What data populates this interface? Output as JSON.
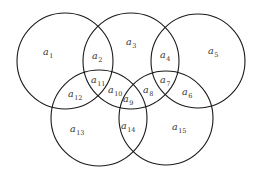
{
  "diagram": {
    "type": "five-set-venn",
    "stroke_color": "#1a1a1a",
    "text_color": "#333333",
    "circles": [
      {
        "id": "top-left",
        "cx": 65,
        "cy": 61,
        "r": 48
      },
      {
        "id": "top-middle",
        "cx": 131,
        "cy": 61,
        "r": 48
      },
      {
        "id": "top-right",
        "cx": 198,
        "cy": 61,
        "r": 47
      },
      {
        "id": "bottom-left",
        "cx": 99,
        "cy": 118,
        "r": 48
      },
      {
        "id": "bottom-right",
        "cx": 166,
        "cy": 118,
        "r": 47
      }
    ],
    "regions": [
      {
        "base": "a",
        "sub": "1",
        "x": 43,
        "y": 55
      },
      {
        "base": "a",
        "sub": "2",
        "x": 92,
        "y": 59
      },
      {
        "base": "a",
        "sub": "3",
        "x": 126,
        "y": 45
      },
      {
        "base": "a",
        "sub": "4",
        "x": 160,
        "y": 58
      },
      {
        "base": "a",
        "sub": "5",
        "x": 208,
        "y": 54
      },
      {
        "base": "a",
        "sub": "6",
        "x": 182,
        "y": 95
      },
      {
        "base": "a",
        "sub": "7",
        "x": 160,
        "y": 83
      },
      {
        "base": "a",
        "sub": "8",
        "x": 143,
        "y": 93
      },
      {
        "base": "a",
        "sub": "9",
        "x": 123,
        "y": 102
      },
      {
        "base": "a",
        "sub": "10",
        "x": 108,
        "y": 93
      },
      {
        "base": "a",
        "sub": "11",
        "x": 91,
        "y": 83
      },
      {
        "base": "a",
        "sub": "12",
        "x": 68,
        "y": 97
      },
      {
        "base": "a",
        "sub": "13",
        "x": 70,
        "y": 132
      },
      {
        "base": "a",
        "sub": "14",
        "x": 121,
        "y": 129
      },
      {
        "base": "a",
        "sub": "15",
        "x": 172,
        "y": 130
      }
    ]
  }
}
